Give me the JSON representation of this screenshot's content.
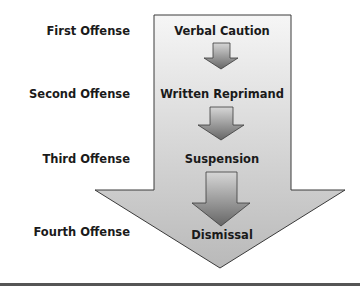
{
  "diagram": {
    "type": "progressive-discipline-flow",
    "offenses": [
      {
        "label": "First Offense",
        "action": "Verbal Caution"
      },
      {
        "label": "Second Offense",
        "action": "Written Reprimand"
      },
      {
        "label": "Third Offense",
        "action": "Suspension"
      },
      {
        "label": "Fourth Offense",
        "action": "Dismissal"
      }
    ],
    "colors": {
      "big_arrow_fill_top": "#f4f4f4",
      "big_arrow_fill_bottom": "#bdbdbd",
      "small_arrow_fill_top": "#cfcfcf",
      "small_arrow_fill_bottom": "#6e6e6e",
      "outline": "#3a3a3a",
      "text": "#1a1a1a"
    }
  }
}
